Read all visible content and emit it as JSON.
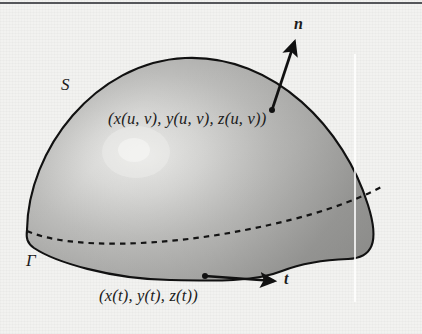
{
  "figure": {
    "kind": "math-diagram",
    "background_color": "#f2f2f0",
    "surface_fill_dark": "#9a9a9a",
    "surface_fill_light": "#e6e6e4",
    "outline_color": "#111111",
    "rule_color": "#55565a"
  },
  "labels": {
    "surface_symbol": "S",
    "boundary_symbol": "Γ",
    "normal_vector": "n",
    "tangent_vector": "t",
    "surface_point": {
      "open": "(",
      "text": "x(u, v), y(u, v), z(u, v)",
      "close": ")",
      "full": "(x(u, v), y(u, v), z(u, v))"
    },
    "curve_point": {
      "open": "(",
      "text": "x(t), y(t), z(t)",
      "close": ")",
      "full": "(x(t), y(t), z(t))"
    }
  },
  "icons": {
    "normal_arrow": "arrow-up-right-icon",
    "tangent_arrow": "arrow-right-icon",
    "surface_anchor_dot": "point-dot-icon",
    "curve_anchor_dot": "point-dot-icon",
    "hidden_edge": "dashed-curve-icon"
  },
  "geometry": {
    "surface_outline_path": "M 27 230 C 28 150, 95 62, 185 58 C 275 54, 345 130, 368 205 C 380 243, 372 258, 348 259 C 320 260, 300 264, 282 271 C 255 282, 215 281, 170 280 C 110 279, 55 262, 34 248 C 27 243, 26 238, 27 230 Z",
    "hidden_edge_path": "M 27 231 C 70 248, 160 245, 240 231 C 310 219, 355 203, 382 188",
    "normal_arrow": {
      "x1": 272,
      "y1": 110,
      "x2": 294,
      "y2": 40
    },
    "tangent_arrow": {
      "x1": 205,
      "y1": 276,
      "x2": 276,
      "y2": 281
    },
    "scanline_x": 355
  }
}
